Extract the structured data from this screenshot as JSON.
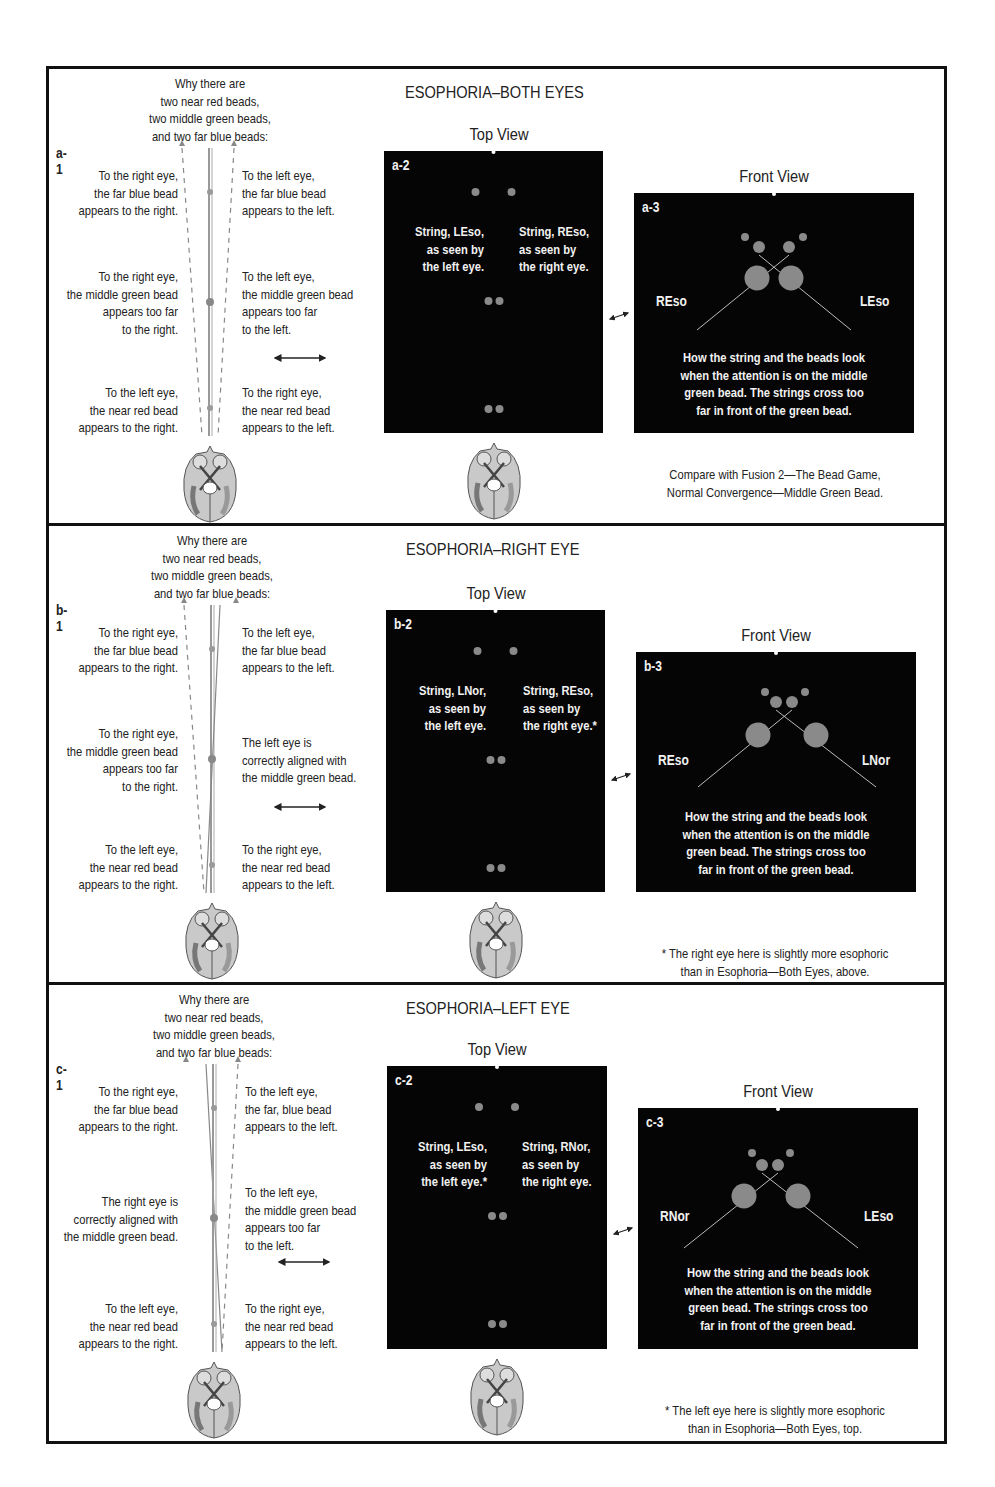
{
  "figure": {
    "panels": [
      {
        "id": "a",
        "title": "ESOPHORIA–BOTH EYES",
        "side_diagram": {
          "label": "a-1",
          "heading": [
            "Why there are",
            "two near red beads,",
            "two middle green beads,",
            "and two far blue beads:"
          ],
          "far_left": [
            "To the right eye,",
            "the far blue bead",
            "appears to the right."
          ],
          "far_right": [
            "To the left eye,",
            "the far blue bead",
            "appears to the left."
          ],
          "middle_left": [
            "To the right eye,",
            "the middle green bead",
            "appears too far",
            "to the right."
          ],
          "middle_right": [
            "To the left eye,",
            "the middle green bead",
            "appears too far",
            "to the left."
          ],
          "near_left": [
            "To the left eye,",
            "the near red bead",
            "appears to the right."
          ],
          "near_right": [
            "To the right eye,",
            "the near red bead",
            "appears to the left."
          ]
        },
        "top_view": {
          "heading": "Top View",
          "label": "a-2",
          "left_caption": [
            "String, LEso,",
            "as seen by",
            "the left eye."
          ],
          "right_caption": [
            "String, REso,",
            "as seen by",
            "the right eye."
          ]
        },
        "front_view": {
          "heading": "Front View",
          "label": "a-3",
          "left_tag": "REso",
          "right_tag": "LEso",
          "caption": [
            "How the string and the beads look",
            "when the attention is on the middle",
            "green bead. The strings cross too",
            "far in front of the green bead."
          ]
        },
        "note": [
          "Compare with Fusion 2—The Bead Game,",
          "Normal Convergence—Middle Green Bead."
        ]
      },
      {
        "id": "b",
        "title": "ESOPHORIA–RIGHT EYE",
        "side_diagram": {
          "label": "b-1",
          "heading": [
            "Why there are",
            "two near red beads,",
            "two middle green beads,",
            "and two far blue beads:"
          ],
          "far_left": [
            "To the right eye,",
            "the far blue bead",
            "appears to the right."
          ],
          "far_right": [
            "To the left eye,",
            "the far blue bead",
            "appears to the left."
          ],
          "middle_left": [
            "To the right eye,",
            "the middle green bead",
            "appears too far",
            "to the right."
          ],
          "middle_right": [
            "The left eye is",
            "correctly aligned with",
            "the middle green bead."
          ],
          "near_left": [
            "To the left eye,",
            "the near red bead",
            "appears to the right."
          ],
          "near_right": [
            "To the right eye,",
            "the near red bead",
            "appears to the left."
          ]
        },
        "top_view": {
          "heading": "Top View",
          "label": "b-2",
          "left_caption": [
            "String, LNor,",
            "as seen by",
            "the left eye."
          ],
          "right_caption": [
            "String, REso,",
            "as seen by",
            "the right eye.*"
          ]
        },
        "front_view": {
          "heading": "Front View",
          "label": "b-3",
          "left_tag": "REso",
          "right_tag": "LNor",
          "caption": [
            "How the string and the beads look",
            "when the attention is on the middle",
            "green bead. The strings cross too",
            "far in front of the green bead."
          ]
        },
        "note": [
          "* The right eye here is slightly more esophoric",
          "than in Esophoria—Both Eyes, above."
        ]
      },
      {
        "id": "c",
        "title": "ESOPHORIA–LEFT EYE",
        "side_diagram": {
          "label": "c-1",
          "heading": [
            "Why there are",
            "two near red beads,",
            "two middle green beads,",
            "and two far blue beads:"
          ],
          "far_left": [
            "To the right eye,",
            "the far blue bead",
            "appears to the right."
          ],
          "far_right": [
            "To the left eye,",
            "the far, blue bead",
            "appears to the left."
          ],
          "middle_left": [
            "The right eye is",
            "correctly aligned with",
            "the middle green bead."
          ],
          "middle_right": [
            "To the left eye,",
            "the middle green bead",
            "appears too far",
            "to the left."
          ],
          "near_left": [
            "To the left eye,",
            "the near red bead",
            "appears to the right."
          ],
          "near_right": [
            "To the right eye,",
            "the near red bead",
            "appears to the left."
          ]
        },
        "top_view": {
          "heading": "Top View",
          "label": "c-2",
          "left_caption": [
            "String, LEso,",
            "as seen by",
            "the left eye.*"
          ],
          "right_caption": [
            "String, RNor,",
            "as seen by",
            "the right eye."
          ]
        },
        "front_view": {
          "heading": "Front View",
          "label": "c-3",
          "left_tag": "RNor",
          "right_tag": "LEso",
          "caption": [
            "How the string and the beads look",
            "when the attention is on the middle",
            "green bead. The strings cross too",
            "far in front of the green bead."
          ]
        },
        "note": [
          "* The left eye here is slightly more esophoric",
          "than in Esophoria—Both Eyes, top."
        ]
      }
    ],
    "colors": {
      "frame": "#111111",
      "box_bg": "#050505",
      "bead": "#8a8a8a",
      "brain_fill": "#c9c9c9",
      "text": "#222222",
      "box_text": "#f2f2f2"
    }
  }
}
